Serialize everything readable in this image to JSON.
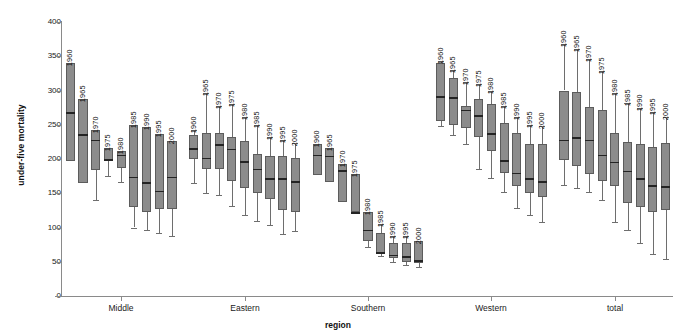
{
  "chart_data": {
    "type": "box",
    "title": "",
    "xlabel": "region",
    "ylabel": "under-five mortality",
    "ylim": [
      0,
      400
    ],
    "yticks": [
      0,
      50,
      100,
      150,
      200,
      250,
      300,
      350,
      400
    ],
    "grid": false,
    "legend": "none",
    "box_fill_color": "#8c8c8c",
    "box_border_color": "#5c5c5c",
    "median_color": "#242424",
    "whisker_color": "#6e6e6e",
    "axis_color": "#8a8a8a",
    "series_label_field": "year",
    "groups": [
      {
        "name": "Middle",
        "boxes": [
          {
            "year": "1960",
            "whisker_low": 197,
            "q1": 197,
            "median": 268,
            "q3": 340,
            "whisker_high": 340
          },
          {
            "year": "1965",
            "whisker_low": 165,
            "q1": 165,
            "median": 236,
            "q3": 288,
            "whisker_high": 288
          },
          {
            "year": "1970",
            "whisker_low": 140,
            "q1": 184,
            "median": 228,
            "q3": 243,
            "whisker_high": 243
          },
          {
            "year": "1975",
            "whisker_low": 175,
            "q1": 198,
            "median": 200,
            "q3": 216,
            "whisker_high": 216
          },
          {
            "year": "1980",
            "whisker_low": 166,
            "q1": 187,
            "median": 206,
            "q3": 211,
            "whisker_high": 211
          },
          {
            "year": "1985",
            "whisker_low": 100,
            "q1": 130,
            "median": 174,
            "q3": 250,
            "whisker_high": 250
          },
          {
            "year": "1990",
            "whisker_low": 96,
            "q1": 123,
            "median": 166,
            "q3": 246,
            "whisker_high": 246
          },
          {
            "year": "1995",
            "whisker_low": 92,
            "q1": 127,
            "median": 154,
            "q3": 236,
            "whisker_high": 236
          },
          {
            "year": "2000",
            "whisker_low": 88,
            "q1": 127,
            "median": 174,
            "q3": 226,
            "whisker_high": 226
          }
        ]
      },
      {
        "name": "Eastern",
        "boxes": [
          {
            "year": "1960",
            "whisker_low": 165,
            "q1": 200,
            "median": 216,
            "q3": 235,
            "whisker_high": 243
          },
          {
            "year": "1965",
            "whisker_low": 150,
            "q1": 186,
            "median": 202,
            "q3": 238,
            "whisker_high": 296
          },
          {
            "year": "1970",
            "whisker_low": 147,
            "q1": 185,
            "median": 222,
            "q3": 238,
            "whisker_high": 277
          },
          {
            "year": "1975",
            "whisker_low": 132,
            "q1": 168,
            "median": 215,
            "q3": 232,
            "whisker_high": 280
          },
          {
            "year": "1980",
            "whisker_low": 118,
            "q1": 158,
            "median": 197,
            "q3": 226,
            "whisker_high": 262
          },
          {
            "year": "1985",
            "whisker_low": 110,
            "q1": 150,
            "median": 186,
            "q3": 208,
            "whisker_high": 250
          },
          {
            "year": "1990",
            "whisker_low": 104,
            "q1": 142,
            "median": 172,
            "q3": 205,
            "whisker_high": 232
          },
          {
            "year": "1995",
            "whisker_low": 90,
            "q1": 126,
            "median": 172,
            "q3": 205,
            "whisker_high": 228
          },
          {
            "year": "2000",
            "whisker_low": 95,
            "q1": 122,
            "median": 168,
            "q3": 202,
            "whisker_high": 223
          }
        ]
      },
      {
        "name": "Southern",
        "boxes": [
          {
            "year": "1960",
            "whisker_low": 177,
            "q1": 177,
            "median": 206,
            "q3": 222,
            "whisker_high": 222
          },
          {
            "year": "1965",
            "whisker_low": 166,
            "q1": 166,
            "median": 205,
            "q3": 216,
            "whisker_high": 216
          },
          {
            "year": "1970",
            "whisker_low": 137,
            "q1": 137,
            "median": 184,
            "q3": 193,
            "whisker_high": 193
          },
          {
            "year": "1975",
            "whisker_low": 122,
            "q1": 122,
            "median": 122,
            "q3": 178,
            "whisker_high": 178
          },
          {
            "year": "1980",
            "whisker_low": 72,
            "q1": 80,
            "median": 97,
            "q3": 123,
            "whisker_high": 123
          },
          {
            "year": "1985",
            "whisker_low": 58,
            "q1": 62,
            "median": 64,
            "q3": 92,
            "whisker_high": 105
          },
          {
            "year": "1990",
            "whisker_low": 50,
            "q1": 55,
            "median": 60,
            "q3": 78,
            "whisker_high": 88
          },
          {
            "year": "1995",
            "whisker_low": 45,
            "q1": 50,
            "median": 58,
            "q3": 78,
            "whisker_high": 88
          },
          {
            "year": "2000",
            "whisker_low": 42,
            "q1": 48,
            "median": 52,
            "q3": 80,
            "whisker_high": 80
          }
        ]
      },
      {
        "name": "Western",
        "boxes": [
          {
            "year": "1960",
            "whisker_low": 248,
            "q1": 255,
            "median": 292,
            "q3": 340,
            "whisker_high": 343
          },
          {
            "year": "1965",
            "whisker_low": 235,
            "q1": 250,
            "median": 290,
            "q3": 318,
            "whisker_high": 330
          },
          {
            "year": "1970",
            "whisker_low": 222,
            "q1": 245,
            "median": 272,
            "q3": 278,
            "whisker_high": 312
          },
          {
            "year": "1975",
            "whisker_low": 185,
            "q1": 232,
            "median": 264,
            "q3": 288,
            "whisker_high": 310
          },
          {
            "year": "1980",
            "whisker_low": 172,
            "q1": 212,
            "median": 238,
            "q3": 280,
            "whisker_high": 300
          },
          {
            "year": "1985",
            "whisker_low": 152,
            "q1": 180,
            "median": 198,
            "q3": 252,
            "whisker_high": 278
          },
          {
            "year": "1990",
            "whisker_low": 128,
            "q1": 160,
            "median": 180,
            "q3": 238,
            "whisker_high": 262
          },
          {
            "year": "1995",
            "whisker_low": 118,
            "q1": 150,
            "median": 172,
            "q3": 222,
            "whisker_high": 250
          },
          {
            "year": "2000",
            "whisker_low": 108,
            "q1": 145,
            "median": 168,
            "q3": 222,
            "whisker_high": 248
          }
        ]
      },
      {
        "name": "total",
        "boxes": [
          {
            "year": "1960",
            "whisker_low": 162,
            "q1": 198,
            "median": 228,
            "q3": 300,
            "whisker_high": 368
          },
          {
            "year": "1965",
            "whisker_low": 158,
            "q1": 190,
            "median": 232,
            "q3": 298,
            "whisker_high": 360
          },
          {
            "year": "1970",
            "whisker_low": 152,
            "q1": 178,
            "median": 228,
            "q3": 276,
            "whisker_high": 346
          },
          {
            "year": "1975",
            "whisker_low": 140,
            "q1": 168,
            "median": 206,
            "q3": 272,
            "whisker_high": 328
          },
          {
            "year": "1980",
            "whisker_low": 108,
            "q1": 160,
            "median": 196,
            "q3": 238,
            "whisker_high": 296
          },
          {
            "year": "1985",
            "whisker_low": 96,
            "q1": 136,
            "median": 183,
            "q3": 225,
            "whisker_high": 282
          },
          {
            "year": "1990",
            "whisker_low": 78,
            "q1": 130,
            "median": 172,
            "q3": 222,
            "whisker_high": 274
          },
          {
            "year": "1995",
            "whisker_low": 62,
            "q1": 122,
            "median": 162,
            "q3": 218,
            "whisker_high": 268
          },
          {
            "year": "2000",
            "whisker_low": 54,
            "q1": 126,
            "median": 160,
            "q3": 224,
            "whisker_high": 262
          }
        ]
      }
    ]
  },
  "axes": {
    "y_title": "under-five mortality",
    "x_title": "region",
    "y_tick_labels": [
      "400",
      "350",
      "300",
      "250",
      "200",
      "150",
      "100",
      "50",
      "0"
    ]
  }
}
